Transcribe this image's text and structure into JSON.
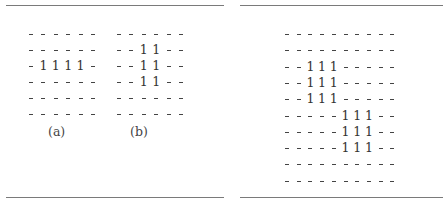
{
  "figures": [
    {
      "id": "a",
      "caption": "(a)",
      "rows": [
        "------",
        "------",
        "-1111-",
        "------",
        "------",
        "------"
      ],
      "origin": {
        "x": 26,
        "y": 27
      },
      "col_step": 12.4,
      "row_step": 16,
      "caption_pos": {
        "x": 48,
        "y": 124
      }
    },
    {
      "id": "b",
      "caption": "(b)",
      "rows": [
        "------",
        "--11--",
        "--11--",
        "--11--",
        "------",
        "------"
      ],
      "origin": {
        "x": 114,
        "y": 27
      },
      "col_step": 12.4,
      "row_step": 16,
      "caption_pos": {
        "x": 130,
        "y": 124
      }
    },
    {
      "id": "c",
      "caption": "",
      "rows": [
        "----------",
        "----------",
        "--111-----",
        "--111-----",
        "--111-----",
        "-----111--",
        "-----111--",
        "-----111--",
        "----------",
        "----------"
      ],
      "origin": {
        "x": 282,
        "y": 27
      },
      "col_step": 11.7,
      "row_step": 16.3,
      "caption_pos": null
    }
  ],
  "rules": [
    {
      "x": 6,
      "y": 5,
      "w": 218
    },
    {
      "x": 240,
      "y": 5,
      "w": 203
    },
    {
      "x": 6,
      "y": 197,
      "w": 218
    },
    {
      "x": 240,
      "y": 197,
      "w": 203
    }
  ]
}
